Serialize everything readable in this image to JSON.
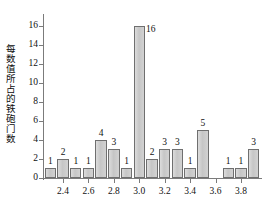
{
  "chart_data": {
    "type": "bar",
    "title": "",
    "subtitle": "",
    "xlabel": "",
    "ylabel": "每数值所占的铁砲门数",
    "xlim": [
      2.25,
      3.95
    ],
    "ylim": [
      0,
      17
    ],
    "grid": false,
    "legend": null,
    "bar_fill_color": "#cccccc",
    "bar_edge_color": "#6f6f6f",
    "axis_color": "#7b7b7b",
    "x_tick_labels": [
      "2.4",
      "2.6",
      "2.8",
      "3.0",
      "3.2",
      "3.4",
      "3.6",
      "3.8"
    ],
    "x_tick_values": [
      2.4,
      2.6,
      2.8,
      3.0,
      3.2,
      3.4,
      3.6,
      3.8
    ],
    "y_tick_labels": [
      "0",
      "2",
      "4",
      "6",
      "8",
      "10",
      "12",
      "14",
      "16"
    ],
    "y_tick_values": [
      0,
      2,
      4,
      6,
      8,
      10,
      12,
      14,
      16
    ],
    "categories": [
      "2.3",
      "2.4",
      "2.5",
      "2.6",
      "2.7",
      "2.8",
      "2.9",
      "3.0",
      "3.1",
      "3.2",
      "3.3",
      "3.4",
      "3.5",
      "3.6",
      "3.7",
      "3.8",
      "3.9"
    ],
    "values": [
      1,
      2,
      1,
      1,
      4,
      3,
      1,
      16,
      2,
      3,
      3,
      1,
      5,
      0,
      1,
      1,
      3
    ],
    "data_labels": [
      "1",
      "2",
      "1",
      "1",
      "4",
      "3",
      "1",
      "16",
      "2",
      "3",
      "3",
      "1",
      "5",
      "",
      "1",
      "1",
      "3"
    ],
    "bars": [
      {
        "x": "2.3",
        "value": 1,
        "label": "1"
      },
      {
        "x": "2.4",
        "value": 2,
        "label": "2"
      },
      {
        "x": "2.5",
        "value": 1,
        "label": "1"
      },
      {
        "x": "2.6",
        "value": 1,
        "label": "1"
      },
      {
        "x": "2.7",
        "value": 4,
        "label": "4"
      },
      {
        "x": "2.8",
        "value": 3,
        "label": "3"
      },
      {
        "x": "2.9",
        "value": 1,
        "label": "1"
      },
      {
        "x": "3.0",
        "value": 16,
        "label": "16"
      },
      {
        "x": "3.1",
        "value": 2,
        "label": "2"
      },
      {
        "x": "3.2",
        "value": 3,
        "label": "3"
      },
      {
        "x": "3.3",
        "value": 3,
        "label": "3"
      },
      {
        "x": "3.4",
        "value": 1,
        "label": "1"
      },
      {
        "x": "3.5",
        "value": 5,
        "label": "5"
      },
      {
        "x": "3.6",
        "value": 0,
        "label": ""
      },
      {
        "x": "3.7",
        "value": 1,
        "label": "1"
      },
      {
        "x": "3.8",
        "value": 1,
        "label": "1"
      },
      {
        "x": "3.9",
        "value": 3,
        "label": "3"
      }
    ]
  }
}
